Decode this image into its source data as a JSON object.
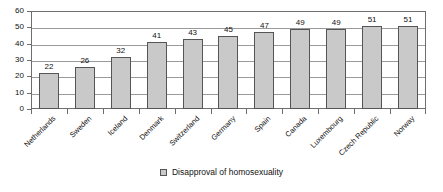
{
  "chart_data": {
    "type": "bar",
    "title": "",
    "subtitle": "",
    "xlabel": "",
    "ylabel": "",
    "categories": [
      "Netherlands",
      "Sweden",
      "Iceland",
      "Denmark",
      "Switzerland",
      "Germany",
      "Spain",
      "Canada",
      "Luxembourg",
      "Czech Republic",
      "Norway"
    ],
    "values": [
      22,
      26,
      32,
      41,
      43,
      45,
      47,
      49,
      49,
      51,
      51
    ],
    "series": [
      {
        "name": "Disapproval of homosexuality",
        "values": [
          22,
          26,
          32,
          41,
          43,
          45,
          47,
          49,
          49,
          51,
          51
        ]
      }
    ],
    "ylim": [
      0,
      60
    ],
    "yticks": [
      0,
      10,
      20,
      30,
      40,
      50,
      60
    ],
    "ytick_labels": [
      "0",
      "10",
      "20",
      "30",
      "40",
      "50",
      "60"
    ],
    "grid": true,
    "grid_axis": "y",
    "legend": {
      "position": "bottom-center",
      "entries": [
        "Disapproval of homosexuality"
      ]
    },
    "data_labels": [
      "22",
      "26",
      "32",
      "41",
      "43",
      "45",
      "47",
      "49",
      "49",
      "51",
      "51"
    ],
    "xtick_label_rotation": -45,
    "colors": {
      "bar_fill": "#c9c9c9",
      "bar_border": "#555555",
      "gridline": "#9a9a9a",
      "axis": "#6e6e6e",
      "text": "#111111",
      "background": "#ffffff"
    }
  },
  "legend": {
    "swatch_name": "legend-swatch-disapproval",
    "label": "Disapproval of homosexuality"
  }
}
